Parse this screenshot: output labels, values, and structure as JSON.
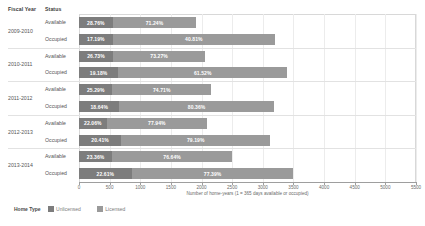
{
  "header": {
    "fiscal_year_label": "Fiscal Year",
    "status_label": "Status"
  },
  "axis": {
    "title": "Number of home-years (1 = 365 days available or occupied)",
    "ticks": [
      "0",
      "500",
      "1000",
      "1500",
      "2000",
      "2500",
      "3000",
      "3500",
      "4000",
      "4500",
      "5000",
      "5500"
    ]
  },
  "legend": {
    "title": "Home Type",
    "items": [
      {
        "label": "Unlicensed",
        "color": "#7d7d7d"
      },
      {
        "label": "Licensed",
        "color": "#9a9a9a"
      }
    ]
  },
  "colors": {
    "series_a": "#7d7d7d",
    "series_b": "#9a9a9a",
    "grid": "#ececec",
    "axis": "#9e9e9e"
  },
  "chart_data": {
    "type": "bar",
    "orientation": "horizontal",
    "stacked": true,
    "title": "",
    "xlabel": "Number of home-years (1 = 365 days available or occupied)",
    "ylabel": "",
    "xlim": [
      0,
      5500
    ],
    "grid": true,
    "legend_position": "bottom-left",
    "categories": [
      "Fiscal Year",
      "Status"
    ],
    "series": [
      {
        "name": "Unlicensed",
        "color": "#7d7d7d"
      },
      {
        "name": "Licensed",
        "color": "#9a9a9a"
      }
    ],
    "groups": [
      {
        "fiscal_year": "2009-2010",
        "rows": [
          {
            "status": "Available",
            "segments": [
              {
                "series": "Unlicensed",
                "pct_label": "28.76%",
                "pct": 28.76,
                "value": 550
              },
              {
                "series": "Licensed",
                "pct_label": "71.24%",
                "pct": 71.24,
                "value": 1362
              }
            ],
            "total": 1912
          },
          {
            "status": "Occupied",
            "pct_note": "",
            "segments": [
              {
                "series": "Unlicensed",
                "pct_label": "17.19%",
                "pct": 17.19,
                "value": 550
              },
              {
                "series": "Licensed",
                "pct_label": "40.81%",
                "pct": 40.81,
                "value": 2650
              }
            ],
            "total": 3200
          }
        ]
      },
      {
        "fiscal_year": "2010-2011",
        "rows": [
          {
            "status": "Available",
            "segments": [
              {
                "series": "Unlicensed",
                "pct_label": "26.73%",
                "pct": 26.73,
                "value": 552
              },
              {
                "series": "Licensed",
                "pct_label": "73.27%",
                "pct": 73.27,
                "value": 1512
              }
            ],
            "total": 2064
          },
          {
            "status": "Occupied",
            "segments": [
              {
                "series": "Unlicensed",
                "pct_label": "19.18%",
                "pct": 19.18,
                "value": 640
              },
              {
                "series": "Licensed",
                "pct_label": "61.52%",
                "pct": 61.52,
                "value": 2760
              }
            ],
            "total": 3400
          }
        ]
      },
      {
        "fiscal_year": "2011-2012",
        "rows": [
          {
            "status": "Available",
            "segments": [
              {
                "series": "Unlicensed",
                "pct_label": "25.29%",
                "pct": 25.29,
                "value": 545
              },
              {
                "series": "Licensed",
                "pct_label": "74.71%",
                "pct": 74.71,
                "value": 1610
              }
            ],
            "total": 2155
          },
          {
            "status": "Occupied",
            "segments": [
              {
                "series": "Unlicensed",
                "pct_label": "18.64%",
                "pct": 18.64,
                "value": 660
              },
              {
                "series": "Licensed",
                "pct_label": "80.36%",
                "pct": 80.36,
                "value": 2520
              }
            ],
            "total": 3180
          }
        ]
      },
      {
        "fiscal_year": "2012-2013",
        "rows": [
          {
            "status": "Available",
            "segments": [
              {
                "series": "Unlicensed",
                "pct_label": "22.06%",
                "pct": 22.06,
                "value": 450
              },
              {
                "series": "Licensed",
                "pct_label": "77.94%",
                "pct": 77.94,
                "value": 1640
              }
            ],
            "total": 2090
          },
          {
            "status": "Occupied",
            "segments": [
              {
                "series": "Unlicensed",
                "pct_label": "20.41%",
                "pct": 20.41,
                "value": 690
              },
              {
                "series": "Licensed",
                "pct_label": "79.19%",
                "pct": 79.19,
                "value": 2430
              }
            ],
            "total": 3120
          }
        ]
      },
      {
        "fiscal_year": "2013-2014",
        "rows": [
          {
            "status": "Available",
            "segments": [
              {
                "series": "Unlicensed",
                "pct_label": "23.36%",
                "pct": 23.36,
                "value": 540
              },
              {
                "series": "Licensed",
                "pct_label": "76.64%",
                "pct": 76.64,
                "value": 1960
              }
            ],
            "total": 2500
          },
          {
            "status": "Occupied",
            "segments": [
              {
                "series": "Unlicensed",
                "pct_label": "22.61%",
                "pct": 22.61,
                "value": 860
              },
              {
                "series": "Licensed",
                "pct_label": "77.39%",
                "pct": 77.39,
                "value": 2640
              }
            ],
            "total": 3500
          }
        ]
      }
    ]
  }
}
